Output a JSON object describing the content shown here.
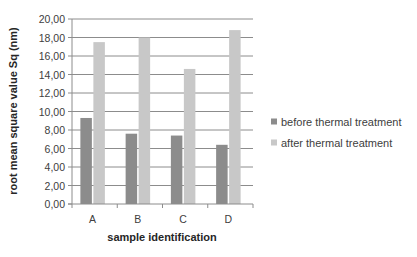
{
  "chart_data": {
    "type": "bar",
    "title": "",
    "xlabel": "sample identification",
    "ylabel": "root mean square value Sq (nm)",
    "categories": [
      "A",
      "B",
      "C",
      "D"
    ],
    "series": [
      {
        "name": "before thermal treatment",
        "color": "#8c8c8c",
        "values": [
          9.3,
          7.6,
          7.4,
          6.4
        ]
      },
      {
        "name": "after thermal treatment",
        "color": "#c8c8c8",
        "values": [
          17.5,
          18.0,
          14.6,
          18.8
        ]
      }
    ],
    "ylim": [
      0,
      20
    ],
    "yticks": [
      "0,00",
      "2,00",
      "4,00",
      "6,00",
      "8,00",
      "10,00",
      "12,00",
      "14,00",
      "16,00",
      "18,00",
      "20,00"
    ],
    "grid": true,
    "legend_position": "right"
  },
  "colors": {
    "gridline": "#8c8c8c",
    "axis": "#8c8c8c"
  }
}
